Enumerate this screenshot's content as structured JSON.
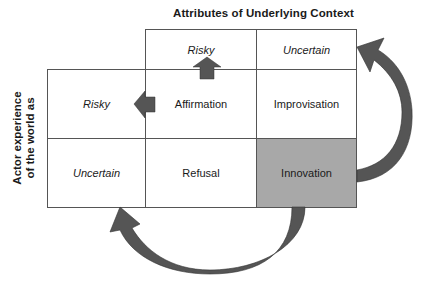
{
  "diagram": {
    "title": "Attributes of Underlying Context",
    "y_axis_label_line1": "Actor experience",
    "y_axis_label_line2": "of the world as",
    "column_headers": [
      "Risky",
      "Uncertain"
    ],
    "row_headers": [
      "Risky",
      "Uncertain"
    ],
    "cells": {
      "risky_risky": "Affirmation",
      "risky_uncertain": "Improvisation",
      "uncertain_risky": "Refusal",
      "uncertain_uncertain": "Innovation"
    },
    "highlighted_cell": "Innovation",
    "colors": {
      "shaded_cell": "#a8a8a8",
      "arrow_fill": "#555555",
      "grid_line": "#555555"
    },
    "arrows": [
      {
        "from": "Affirmation",
        "to": "column header Risky",
        "type": "straight-up"
      },
      {
        "from": "Affirmation",
        "to": "row header Risky",
        "type": "straight-left"
      },
      {
        "from": "Innovation",
        "to": "column header Uncertain",
        "type": "curved"
      },
      {
        "from": "Innovation",
        "to": "row header Uncertain",
        "type": "curved"
      }
    ]
  }
}
